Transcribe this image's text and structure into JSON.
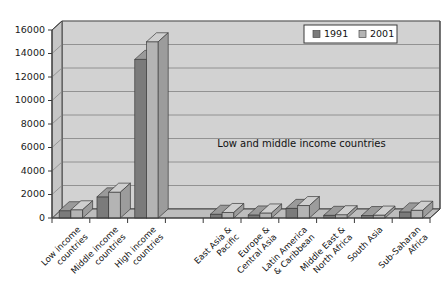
{
  "chart_data": {
    "type": "bar",
    "title": "",
    "subtitle": "",
    "xlabel": "",
    "ylabel": "",
    "ylim": [
      0,
      16000
    ],
    "ytick_labels": [
      "0",
      "2000",
      "4000",
      "6000",
      "8000",
      "10000",
      "12000",
      "14000",
      "16000"
    ],
    "ytick_values": [
      0,
      2000,
      4000,
      6000,
      8000,
      10000,
      12000,
      14000,
      16000
    ],
    "grid": true,
    "three_d": true,
    "legend_position": "top-right",
    "categories": [
      "Low income countries",
      "Middle income countries",
      "High income countries",
      "",
      "East Asia & Pacific",
      "Europe & Central Asia",
      "Latin America & Caribbean",
      "Middle East & North Africa",
      "South Asia",
      "Sub-Saharan Africa"
    ],
    "category_lines": [
      [
        "Low income",
        "countries"
      ],
      [
        "Middle income",
        "countries"
      ],
      [
        "High income",
        "countries"
      ],
      [],
      [
        "East Asia &",
        "Pacific"
      ],
      [
        "Europe &",
        "Central Asia"
      ],
      [
        "Latin America",
        "& Caribbean"
      ],
      [
        "Middle East &",
        "North Africa"
      ],
      [
        "South Asia"
      ],
      [
        "Sub-Saharan",
        "Africa"
      ]
    ],
    "series": [
      {
        "name": "1991",
        "color": "#7b7b7b",
        "values": [
          620,
          1800,
          13500,
          null,
          320,
          260,
          820,
          230,
          210,
          520
        ]
      },
      {
        "name": "2001",
        "color": "#b4b4b4",
        "values": [
          700,
          2200,
          15000,
          null,
          470,
          430,
          1060,
          280,
          250,
          660
        ]
      }
    ],
    "annotations": [
      {
        "text": "Low and middle income countries",
        "x_frac": 0.66,
        "y_value": 5500
      }
    ]
  },
  "legend": {
    "entries": [
      {
        "label": "1991",
        "swatch_color": "#7b7b7b"
      },
      {
        "label": "2001",
        "swatch_color": "#b4b4b4"
      }
    ]
  },
  "colors": {
    "plot_background": "#d2d2d2",
    "floor": "#bdbdbd",
    "gridline": "#8a8a8a",
    "axis": "#3a3a3a",
    "page_background": "#ffffff",
    "series_1991": "#7b7b7b",
    "series_2001": "#b4b4b4",
    "series_1991_top": "#9a9a9a",
    "series_2001_top": "#cfcfcf",
    "series_1991_side": "#636363",
    "series_2001_side": "#9c9c9c",
    "text": "#111111"
  }
}
